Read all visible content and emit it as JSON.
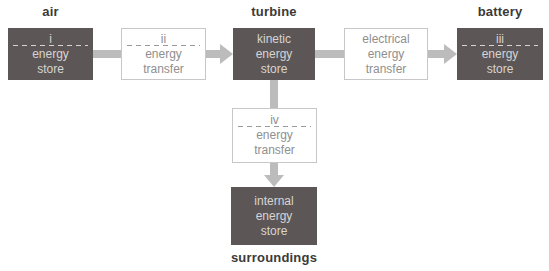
{
  "labels": {
    "air": "air",
    "turbine": "turbine",
    "battery": "battery",
    "surroundings": "surroundings"
  },
  "boxes": {
    "air_store": {
      "numeral": "i",
      "lines": [
        "energy",
        "store"
      ]
    },
    "transfer_ii": {
      "numeral": "ii",
      "lines": [
        "energy",
        "transfer"
      ]
    },
    "kinetic_store": {
      "lines": [
        "kinetic",
        "energy",
        "store"
      ]
    },
    "electrical_transfer": {
      "lines": [
        "electrical",
        "energy",
        "transfer"
      ]
    },
    "battery_store": {
      "numeral": "iii",
      "lines": [
        "energy",
        "store"
      ]
    },
    "transfer_iv": {
      "numeral": "iv",
      "lines": [
        "energy",
        "transfer"
      ]
    },
    "internal_store": {
      "lines": [
        "internal",
        "energy",
        "store"
      ]
    }
  },
  "colors": {
    "store_fill": "#5c5756",
    "store_text": "#d7d4d3",
    "store_dash": "#d7d4d3",
    "transfer_border": "#c7c7c7",
    "transfer_text": "#8f8f8f",
    "transfer_dash": "#9a9a9a",
    "arrow": "#bcbcbc",
    "label_text": "#3b3a39",
    "background": "#ffffff"
  }
}
